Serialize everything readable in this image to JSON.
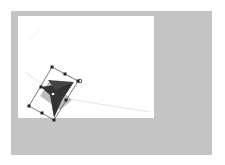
{
  "app": {
    "workspace_color": "#c4c4c4",
    "canvas_color": "#ffffff"
  },
  "selection": {
    "shape": "four-point-star",
    "shape_color": "#333333",
    "shadow_color": "#aaaaaa",
    "bbox_color": "#555555",
    "handles": 8,
    "rotate_handle": true
  }
}
